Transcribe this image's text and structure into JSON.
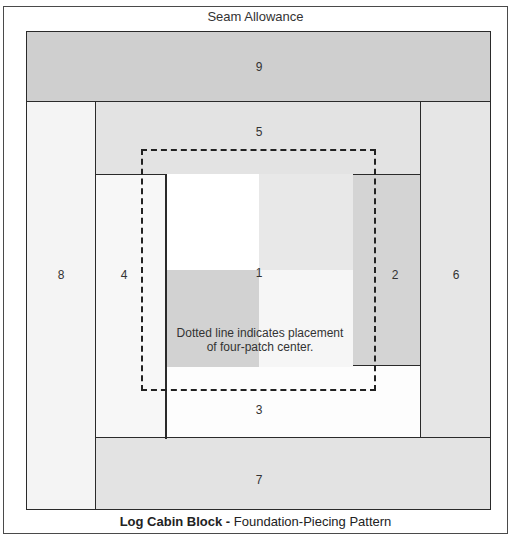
{
  "diagram": {
    "header_label": "Seam Allowance",
    "caption_bold": "Log Cabin Block - ",
    "caption_rest": "Foundation-Piecing Pattern",
    "note_line1": "Dotted line indicates placement",
    "note_line2": "of four-patch center.",
    "pieces": [
      {
        "id": "1",
        "label": "1"
      },
      {
        "id": "2",
        "label": "2"
      },
      {
        "id": "3",
        "label": "3"
      },
      {
        "id": "4",
        "label": "4"
      },
      {
        "id": "5",
        "label": "5"
      },
      {
        "id": "6",
        "label": "6"
      },
      {
        "id": "7",
        "label": "7"
      },
      {
        "id": "8",
        "label": "8"
      },
      {
        "id": "9",
        "label": "9"
      }
    ],
    "colors": {
      "piece_9": "#cfcfcf",
      "piece_8": "#f4f4f4",
      "piece_5": "#e3e3e3",
      "piece_6": "#e6e6e6",
      "piece_4": "#f7f7f7",
      "piece_2": "#d4d4d4",
      "piece_3": "#fdfdfd",
      "piece_7": "#e3e3e3",
      "center_tl": "#ffffff",
      "center_tr": "#e8e8e8",
      "center_bl": "#d2d2d2",
      "center_br": "#f6f6f6"
    }
  }
}
